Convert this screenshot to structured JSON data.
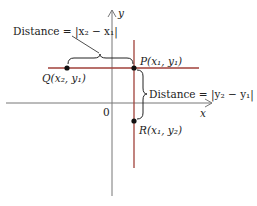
{
  "diagram": {
    "axes": {
      "x_label": "x",
      "y_label": "y",
      "origin_label": "0",
      "axis_color": "#777777"
    },
    "lines": {
      "color": "#a0413a"
    },
    "points": {
      "P": "P(x₁, y₁)",
      "Q": "Q(x₂, y₁)",
      "R": "R(x₁, y₂)"
    },
    "annotations": {
      "horizontal_distance": "Distance = |x₂ − x₁|",
      "vertical_distance": "Distance = |y₂ − y₁|"
    }
  }
}
